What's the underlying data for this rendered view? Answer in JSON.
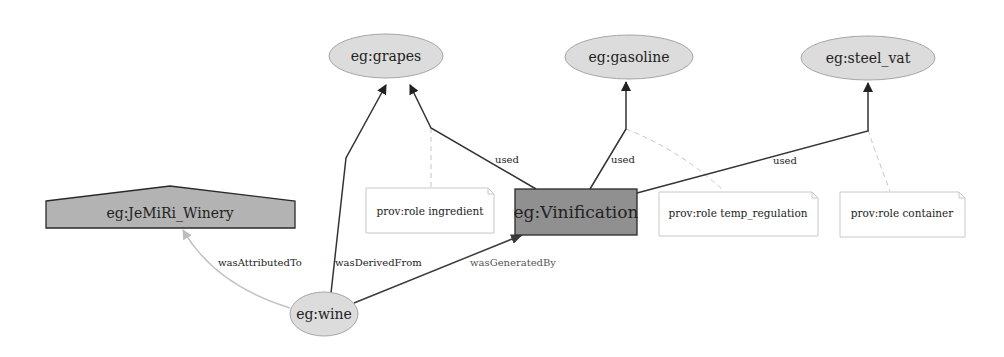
{
  "diagram": {
    "type": "provenance-graph",
    "colors": {
      "entity_fill": "#dcdcdc",
      "entity_stroke": "#a6a6a6",
      "activity_fill": "#909090",
      "activity_stroke": "#2a2a2a",
      "agent_fill": "#b3b3b3",
      "agent_stroke": "#2a2a2a",
      "note_stroke": "#c8c8c8",
      "edge_dark": "#333333",
      "edge_light": "#bdbdbd",
      "edge_dashed": "#c4c4c4"
    },
    "nodes": {
      "grapes": {
        "label": "eg:grapes",
        "kind": "entity"
      },
      "gasoline": {
        "label": "eg:gasoline",
        "kind": "entity"
      },
      "steel_vat": {
        "label": "eg:steel_vat",
        "kind": "entity"
      },
      "winery": {
        "label": "eg:JeMiRi_Winery",
        "kind": "agent"
      },
      "vinification": {
        "label": "eg:Vinification",
        "kind": "activity"
      },
      "wine": {
        "label": "eg:wine",
        "kind": "entity"
      }
    },
    "notes": {
      "ingredient": {
        "label": "prov:role ingredient"
      },
      "temp_regulation": {
        "label": "prov:role temp_regulation"
      },
      "container": {
        "label": "prov:role container"
      }
    },
    "edges": {
      "used_grapes": {
        "from": "eg:Vinification",
        "to": "eg:grapes",
        "label": "used"
      },
      "used_gasoline": {
        "from": "eg:Vinification",
        "to": "eg:gasoline",
        "label": "used"
      },
      "used_steel_vat": {
        "from": "eg:Vinification",
        "to": "eg:steel_vat",
        "label": "used"
      },
      "was_attributed_to": {
        "from": "eg:wine",
        "to": "eg:JeMiRi_Winery",
        "label": "wasAttributedTo"
      },
      "was_derived_from": {
        "from": "eg:wine",
        "to": "eg:grapes",
        "label": "wasDerivedFrom"
      },
      "was_generated_by": {
        "from": "eg:wine",
        "to": "eg:Vinification",
        "label": "wasGeneratedBy"
      }
    }
  }
}
